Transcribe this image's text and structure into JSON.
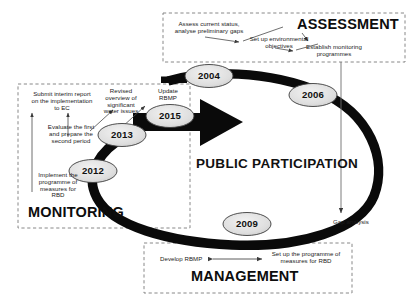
{
  "diagram": {
    "cycle_label": "PUBLIC PARTICIPATION",
    "years": [
      {
        "id": "2004",
        "label": "2004"
      },
      {
        "id": "2006",
        "label": "2006"
      },
      {
        "id": "2009",
        "label": "2009"
      },
      {
        "id": "2012",
        "label": "2012"
      },
      {
        "id": "2013",
        "label": "2013"
      },
      {
        "id": "2015",
        "label": "2015"
      }
    ],
    "assessment": {
      "title": "ASSESSMENT",
      "notes": [
        "Assess current status,\nanalyse preliminary gaps",
        "Set up environmental\nobjectives",
        "Establish monitoring\nprogrammes"
      ]
    },
    "monitoring": {
      "title": "MONITORING",
      "notes": [
        "Submit interim report\non the implementation\nto EC",
        "Revised\noverview of\nsignificant\nwater issues",
        "Update\nRBMP",
        "Evaluate the first\nand prepare the\nsecond period",
        "Implement the\nprogramme of\nmeasures for\nRBD"
      ]
    },
    "management": {
      "title": "MANAGEMENT",
      "notes": [
        "Develop RBMP",
        "Set up the programme of\nmeasures for RBD"
      ]
    },
    "gap_analysis_label": "Gap analysis",
    "colors": {
      "ink": "#111111",
      "loop": "#0a0a0a",
      "ellipse_fill": "#e3e3e3",
      "dashed_border": "#7a7a7a",
      "thin_line": "#6e6e6e"
    }
  }
}
